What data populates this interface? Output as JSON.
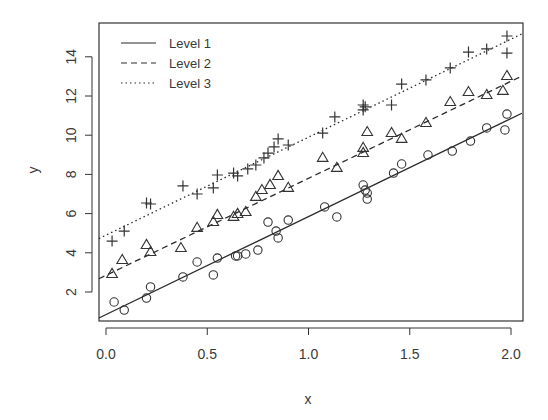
{
  "chart_data": {
    "type": "scatter",
    "title": "",
    "xlabel": "x",
    "ylabel": "y",
    "xlim": [
      -0.035,
      2.054
    ],
    "ylim": [
      0.75,
      15.5
    ],
    "x_ticks": [
      0.0,
      0.5,
      1.0,
      1.5,
      2.0
    ],
    "x_tick_labels": [
      "0.0",
      "0.5",
      "1.0",
      "1.5",
      "2.0"
    ],
    "y_ticks": [
      2,
      4,
      6,
      8,
      10,
      12,
      14
    ],
    "y_tick_labels": [
      "2",
      "4",
      "6",
      "8",
      "10",
      "12",
      "14"
    ],
    "grid": false,
    "legend": {
      "position": "top-left",
      "entries": [
        {
          "label": "Level 1",
          "line": "solid"
        },
        {
          "label": "Level 2",
          "line": "dashed"
        },
        {
          "label": "Level 3",
          "line": "dotted"
        }
      ]
    },
    "series": [
      {
        "name": "Level 1",
        "marker": "circle",
        "line_style": "solid",
        "fit": {
          "intercept": 0.85,
          "slope": 5.0
        },
        "points": [
          [
            0.04,
            1.49
          ],
          [
            0.09,
            1.08
          ],
          [
            0.2,
            1.69
          ],
          [
            0.22,
            2.26
          ],
          [
            0.38,
            2.77
          ],
          [
            0.45,
            3.53
          ],
          [
            0.53,
            2.87
          ],
          [
            0.55,
            3.73
          ],
          [
            0.64,
            3.84
          ],
          [
            0.65,
            3.84
          ],
          [
            0.69,
            3.94
          ],
          [
            0.75,
            4.14
          ],
          [
            0.8,
            5.57
          ],
          [
            0.84,
            5.11
          ],
          [
            0.85,
            4.76
          ],
          [
            0.9,
            5.67
          ],
          [
            1.08,
            6.34
          ],
          [
            1.14,
            5.83
          ],
          [
            1.27,
            7.46
          ],
          [
            1.28,
            7.2
          ],
          [
            1.29,
            7.05
          ],
          [
            1.29,
            6.74
          ],
          [
            1.42,
            8.07
          ],
          [
            1.46,
            8.53
          ],
          [
            1.59,
            8.99
          ],
          [
            1.71,
            9.19
          ],
          [
            1.8,
            9.7
          ],
          [
            1.88,
            10.37
          ],
          [
            1.97,
            10.27
          ],
          [
            1.98,
            11.08
          ]
        ]
      },
      {
        "name": "Level 2",
        "marker": "triangle",
        "line_style": "dashed",
        "fit": {
          "intercept": 2.85,
          "slope": 4.95
        },
        "points": [
          [
            0.03,
            2.92
          ],
          [
            0.08,
            3.63
          ],
          [
            0.2,
            4.4
          ],
          [
            0.22,
            4.04
          ],
          [
            0.37,
            4.24
          ],
          [
            0.45,
            5.27
          ],
          [
            0.53,
            5.57
          ],
          [
            0.55,
            5.93
          ],
          [
            0.63,
            5.83
          ],
          [
            0.65,
            5.98
          ],
          [
            0.69,
            6.08
          ],
          [
            0.74,
            6.85
          ],
          [
            0.77,
            7.2
          ],
          [
            0.81,
            7.46
          ],
          [
            0.85,
            7.92
          ],
          [
            0.9,
            7.31
          ],
          [
            1.07,
            8.84
          ],
          [
            1.14,
            8.33
          ],
          [
            1.27,
            9.35
          ],
          [
            1.27,
            9.09
          ],
          [
            1.29,
            10.16
          ],
          [
            1.41,
            10.11
          ],
          [
            1.46,
            9.81
          ],
          [
            1.58,
            10.62
          ],
          [
            1.7,
            11.69
          ],
          [
            1.79,
            12.2
          ],
          [
            1.88,
            12.05
          ],
          [
            1.96,
            12.26
          ],
          [
            1.98,
            13.02
          ]
        ]
      },
      {
        "name": "Level 3",
        "marker": "plus",
        "line_style": "dotted",
        "fit": {
          "intercept": 4.9,
          "slope": 5.0
        },
        "points": [
          [
            0.03,
            4.6
          ],
          [
            0.09,
            5.11
          ],
          [
            0.2,
            6.54
          ],
          [
            0.22,
            6.49
          ],
          [
            0.38,
            7.41
          ],
          [
            0.45,
            7.0
          ],
          [
            0.53,
            7.31
          ],
          [
            0.55,
            7.97
          ],
          [
            0.63,
            8.07
          ],
          [
            0.65,
            7.92
          ],
          [
            0.7,
            8.28
          ],
          [
            0.74,
            8.48
          ],
          [
            0.78,
            8.84
          ],
          [
            0.8,
            9.09
          ],
          [
            0.83,
            9.4
          ],
          [
            0.85,
            9.81
          ],
          [
            0.9,
            9.5
          ],
          [
            1.07,
            10.11
          ],
          [
            1.13,
            10.93
          ],
          [
            1.27,
            11.54
          ],
          [
            1.27,
            11.29
          ],
          [
            1.28,
            11.45
          ],
          [
            1.41,
            11.54
          ],
          [
            1.46,
            12.61
          ],
          [
            1.58,
            12.82
          ],
          [
            1.7,
            13.43
          ],
          [
            1.79,
            14.24
          ],
          [
            1.88,
            14.4
          ],
          [
            1.98,
            14.19
          ],
          [
            1.98,
            15.06
          ]
        ]
      }
    ],
    "colors": {
      "axis": "#333333",
      "points": "#333333",
      "lines": "#2b2b2b",
      "text": "#3a3a3a",
      "background": "#ffffff"
    }
  }
}
